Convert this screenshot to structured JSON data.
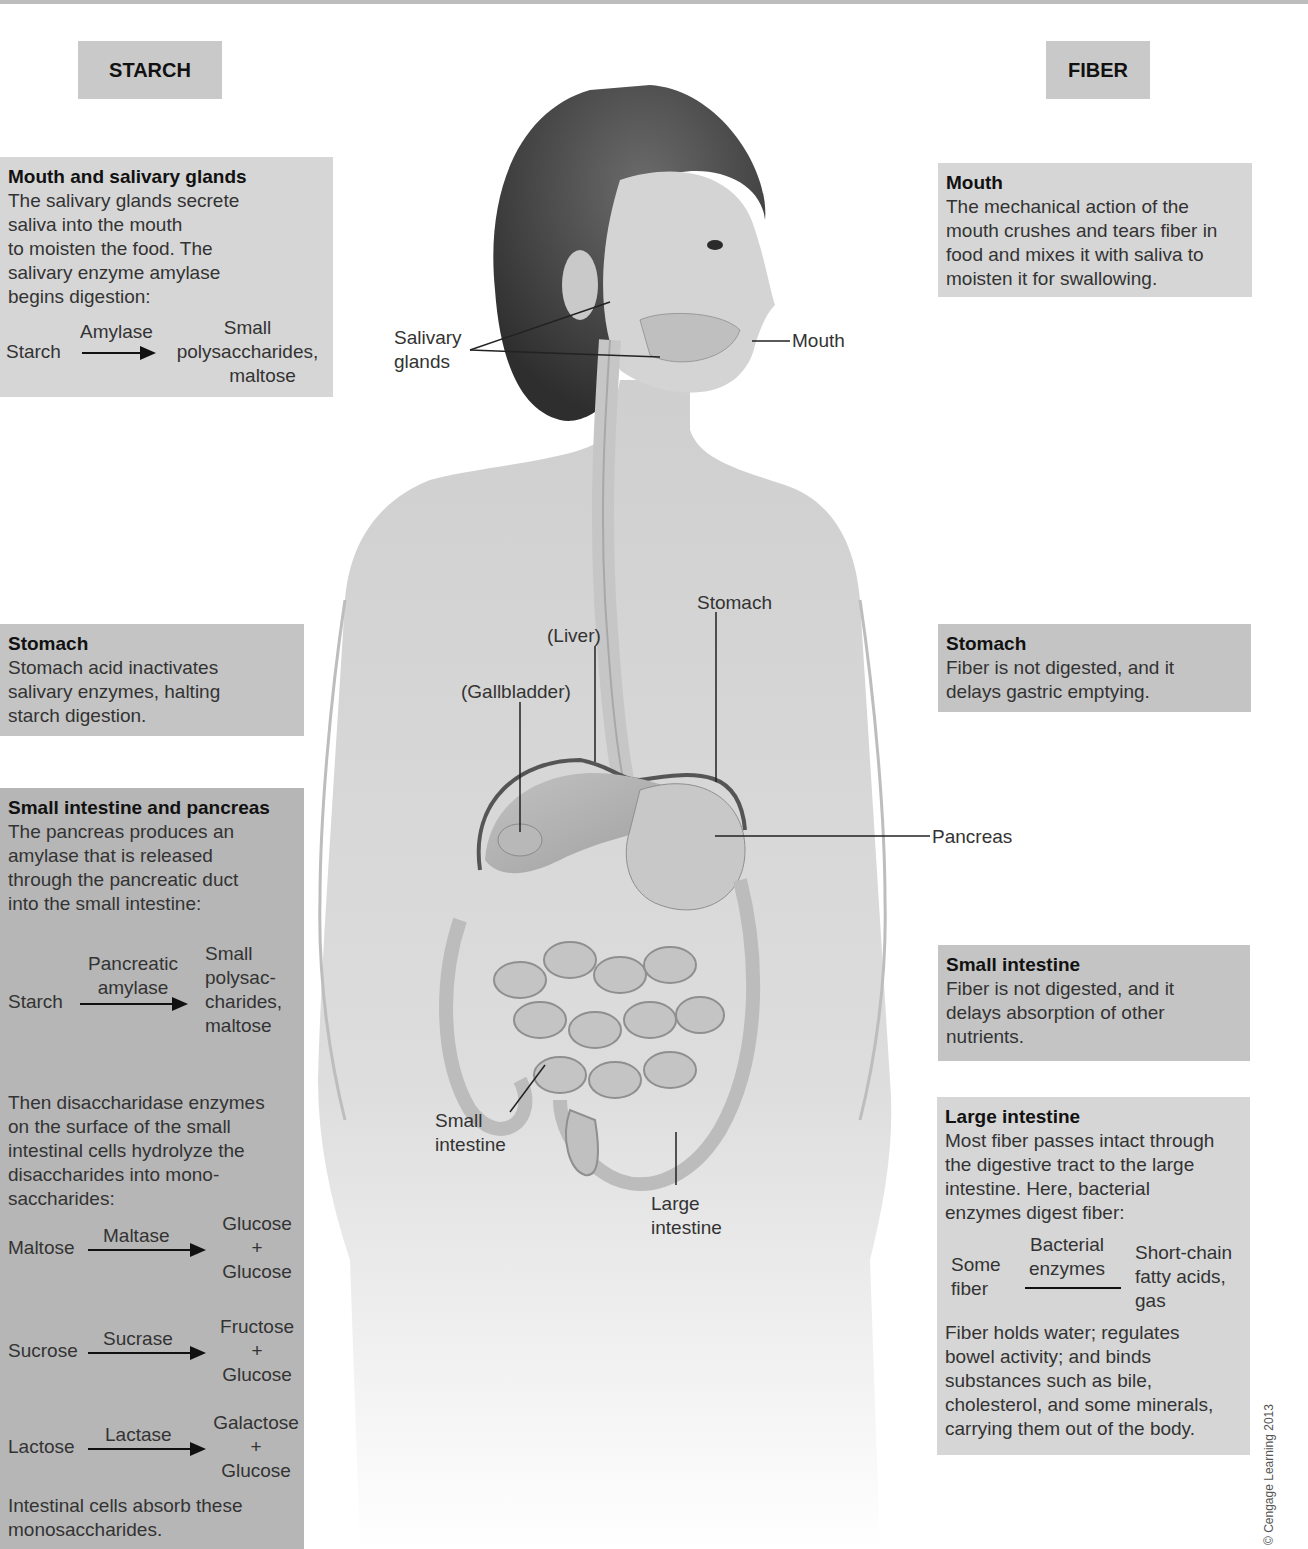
{
  "headers": {
    "starch": "STARCH",
    "fiber": "FIBER"
  },
  "starch": {
    "mouth": {
      "title": "Mouth and salivary glands",
      "lines": [
        "The salivary glands secrete",
        "saliva into the mouth",
        "to moisten the food. The",
        "salivary enzyme amylase",
        "begins digestion:"
      ],
      "reaction": {
        "substrate": "Starch",
        "enzyme": "Amylase",
        "product": [
          "Small",
          "polysaccharides,",
          "maltose"
        ]
      }
    },
    "stomach": {
      "title": "Stomach",
      "lines": [
        "Stomach acid inactivates",
        "salivary enzymes, halting",
        "starch digestion."
      ]
    },
    "small_intestine": {
      "title": "Small intestine and pancreas",
      "lines": [
        "The pancreas produces an",
        "amylase that is released",
        "through the pancreatic duct",
        "into the small intestine:"
      ],
      "reaction": {
        "substrate": "Starch",
        "enzyme": [
          "Pancreatic",
          "amylase"
        ],
        "product": [
          "Small",
          "polysac-",
          "charides,",
          "maltose"
        ]
      },
      "lines2": [
        "Then disaccharidase enzymes",
        "on the surface of the small",
        "intestinal cells hydrolyze the",
        "disaccharides into mono-",
        "saccharides:"
      ],
      "reactions": [
        {
          "substrate": "Maltose",
          "enzyme": "Maltase",
          "product": [
            "Glucose",
            "+",
            "Glucose"
          ]
        },
        {
          "substrate": "Sucrose",
          "enzyme": "Sucrase",
          "product": [
            "Fructose",
            "+",
            "Glucose"
          ]
        },
        {
          "substrate": "Lactose",
          "enzyme": "Lactase",
          "product": [
            "Galactose",
            "+",
            "Glucose"
          ]
        }
      ],
      "closing": [
        "Intestinal cells absorb these",
        "monosaccharides."
      ]
    }
  },
  "fiber": {
    "mouth": {
      "title": "Mouth",
      "lines": [
        "The mechanical action of the",
        "mouth crushes and tears fiber in",
        "food and mixes it with saliva to",
        "moisten it for swallowing."
      ]
    },
    "stomach": {
      "title": "Stomach",
      "lines": [
        "Fiber is not digested, and it",
        "delays gastric emptying."
      ]
    },
    "small_intestine": {
      "title": "Small intestine",
      "lines": [
        "Fiber is not digested, and it",
        "delays absorption of other",
        "nutrients."
      ]
    },
    "large_intestine": {
      "title": "Large intestine",
      "lines": [
        "Most fiber passes intact through",
        "the digestive tract to the large",
        "intestine. Here, bacterial",
        "enzymes digest fiber:"
      ],
      "reaction": {
        "substrate": [
          "Some",
          "fiber"
        ],
        "enzyme": [
          "Bacterial",
          "enzymes"
        ],
        "product": [
          "Short-chain",
          "fatty acids,",
          "gas"
        ]
      },
      "closing": [
        "Fiber holds water; regulates",
        "bowel activity; and binds",
        "substances such as bile,",
        "cholesterol, and some minerals,",
        "carrying them out of the body."
      ]
    }
  },
  "anatomy_labels": {
    "salivary_glands": [
      "Salivary",
      "glands"
    ],
    "mouth": "Mouth",
    "liver": "(Liver)",
    "gallbladder": "(Gallbladder)",
    "stomach": "Stomach",
    "pancreas": "Pancreas",
    "small_intestine": [
      "Small",
      "intestine"
    ],
    "large_intestine": [
      "Large",
      "intestine"
    ]
  },
  "credit": "© Cengage Learning 2013"
}
